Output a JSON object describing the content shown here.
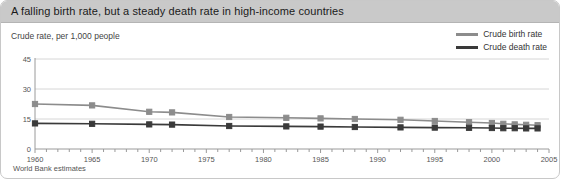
{
  "title": "A falling birth rate, but a steady death rate in high-income countries",
  "axis_caption": "Crude rate, per 1,000 people",
  "footer": "World Bank estimates",
  "colors": {
    "title_bar": "#c9c9c9",
    "birth": "#8c8c8c",
    "death": "#3a3a3a",
    "grid": "#d6d6d6",
    "axis": "#9a9a9a",
    "card_border": "#c8c8c8"
  },
  "legend": {
    "position": "top-right",
    "items": [
      {
        "label": "Crude birth rate",
        "color": "#8c8c8c"
      },
      {
        "label": "Crude death rate",
        "color": "#3a3a3a"
      }
    ]
  },
  "chart_data": {
    "type": "line",
    "title": "A falling birth rate, but a steady death rate in high-income countries",
    "subtitle": "Crude rate, per 1,000 people",
    "source": "World Bank estimates",
    "xlabel": "",
    "ylabel": "Crude rate, per 1,000 people",
    "xlim": [
      1960,
      2005
    ],
    "ylim": [
      0,
      45
    ],
    "yticks": [
      0,
      15,
      30,
      45
    ],
    "xticks": [
      1960,
      1965,
      1970,
      1975,
      1980,
      1985,
      1990,
      1995,
      2000,
      2005
    ],
    "xtick_labels": [
      "1960",
      "1965",
      "1970",
      "1975",
      "1980",
      "1985",
      "1990",
      "1995",
      "2000",
      "2005"
    ],
    "ytick_labels": [
      "0",
      "15",
      "30",
      "45"
    ],
    "minor_xtick_interval": 1,
    "grid": "horizontal",
    "legend_position": "top-right",
    "marker": "square",
    "series": [
      {
        "name": "Crude birth rate",
        "color": "#8c8c8c",
        "x": [
          1960,
          1965,
          1970,
          1972,
          1977,
          1982,
          1985,
          1988,
          1992,
          1995,
          1998,
          2000,
          2001,
          2002,
          2003,
          2004
        ],
        "values": [
          22.5,
          21.8,
          18.6,
          18.3,
          16.0,
          15.6,
          15.3,
          15.0,
          14.6,
          14.0,
          13.4,
          13.0,
          12.6,
          12.3,
          12.1,
          11.9
        ]
      },
      {
        "name": "Crude death rate",
        "color": "#3a3a3a",
        "x": [
          1960,
          1965,
          1970,
          1972,
          1977,
          1982,
          1985,
          1988,
          1992,
          1995,
          1998,
          2000,
          2001,
          2002,
          2003,
          2004
        ],
        "values": [
          12.8,
          12.6,
          12.3,
          12.2,
          11.5,
          11.3,
          11.2,
          11.0,
          10.8,
          10.7,
          10.6,
          10.5,
          10.4,
          10.4,
          10.3,
          10.3
        ]
      }
    ]
  }
}
